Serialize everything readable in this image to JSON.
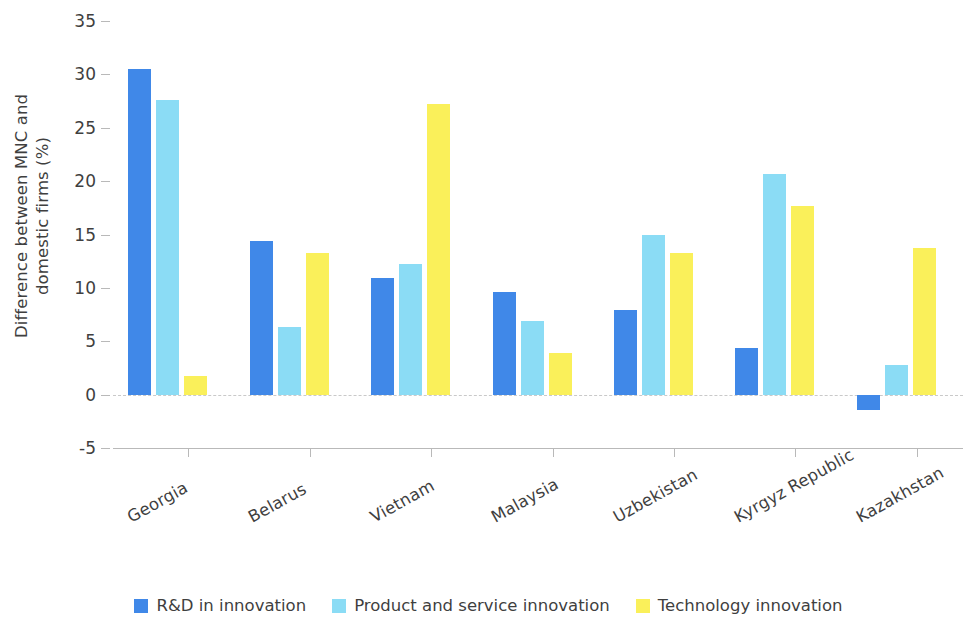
{
  "chart_data": {
    "type": "bar",
    "title": "",
    "subtitle": "",
    "xlabel": "",
    "ylabel": "Difference between MNC and\ndomestic firms (%)",
    "ylim": [
      -5,
      35
    ],
    "ytick_labels": [
      "35",
      "30",
      "25",
      "20",
      "15",
      "10",
      "5",
      "0",
      "-5"
    ],
    "ytick_values": [
      35,
      30,
      25,
      20,
      15,
      10,
      5,
      0,
      -5
    ],
    "grid": false,
    "zero_line": true,
    "legend_position": "bottom-center",
    "categories": [
      "Georgia",
      "Belarus",
      "Vietnam",
      "Malaysia",
      "Uzbekistan",
      "Kyrgyz Republic",
      "Kazakhstan"
    ],
    "series": [
      {
        "name": "R&D in innovation",
        "color": "#4088E8",
        "values": [
          30.5,
          14.4,
          10.9,
          9.6,
          7.9,
          4.4,
          -1.4
        ]
      },
      {
        "name": "Product and service innovation",
        "color": "#8BDCF5",
        "values": [
          27.6,
          6.3,
          12.2,
          6.9,
          15.0,
          20.7,
          2.8
        ]
      },
      {
        "name": "Technology innovation",
        "color": "#FAF05A",
        "values": [
          1.7,
          13.3,
          27.2,
          3.9,
          13.3,
          17.7,
          13.7
        ]
      }
    ]
  },
  "legend": {
    "items": [
      {
        "label": "R&D in innovation",
        "color": "#4088E8"
      },
      {
        "label": "Product and service innovation",
        "color": "#8BDCF5"
      },
      {
        "label": "Technology innovation",
        "color": "#FAF05A"
      }
    ]
  }
}
